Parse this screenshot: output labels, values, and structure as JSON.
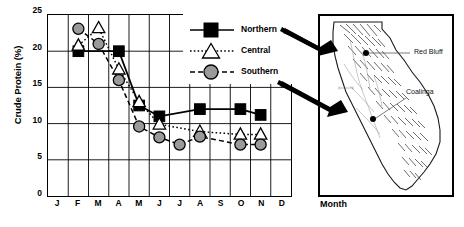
{
  "chart_data": {
    "type": "line",
    "title": "",
    "xlabel": "Month",
    "ylabel": "Crude Protein (%)",
    "categories": [
      "J",
      "F",
      "M",
      "A",
      "M",
      "J",
      "J",
      "A",
      "S",
      "O",
      "N",
      "D"
    ],
    "ylim": [
      0,
      25
    ],
    "ytick_values": [
      0,
      5,
      10,
      15,
      20,
      25
    ],
    "xlim_categories": [
      "J",
      "D"
    ],
    "grid": true,
    "legend_position": "upper-right-inside",
    "series": [
      {
        "name": "Northern",
        "marker": "filled-square",
        "line": "solid",
        "color": "#000000",
        "x": [
          "F",
          "A",
          "M",
          "J",
          "A",
          "O",
          "N"
        ],
        "values": [
          20,
          20,
          12.5,
          11,
          12,
          12,
          11.2
        ]
      },
      {
        "name": "Central",
        "marker": "open-triangle",
        "line": "dotted",
        "color": "#000000",
        "x": [
          "F",
          "M",
          "A",
          "M",
          "J",
          "A",
          "O",
          "N"
        ],
        "values": [
          20.8,
          23.2,
          17.5,
          13,
          9.9,
          8.9,
          8.5,
          8.5
        ]
      },
      {
        "name": "Southern",
        "marker": "filled-circle",
        "line": "dashed",
        "color": "#9a9a9a",
        "x": [
          "F",
          "M",
          "A",
          "M",
          "J",
          "J",
          "A",
          "O",
          "N"
        ],
        "values": [
          23.1,
          21,
          16,
          9.6,
          8.1,
          7.1,
          8.2,
          7.1,
          7.1
        ]
      }
    ]
  },
  "axes": {
    "y_title": "Crude Protein (%)",
    "y_ticks": [
      "25",
      "20",
      "15",
      "10",
      "5",
      "0"
    ],
    "x_ticks": [
      "J",
      "F",
      "M",
      "A",
      "M",
      "J",
      "J",
      "A",
      "S",
      "O",
      "N",
      "D"
    ],
    "x_title": "Month"
  },
  "legend": {
    "items": [
      {
        "label": "Northern",
        "marker": "filled-square-icon",
        "line_style": "solid"
      },
      {
        "label": "Central",
        "marker": "open-triangle-icon",
        "line_style": "dotted"
      },
      {
        "label": "Southern",
        "marker": "filled-circle-icon",
        "line_style": "dashed"
      }
    ]
  },
  "map": {
    "region": "California",
    "cities": [
      {
        "name": "Red Bluff"
      },
      {
        "name": "Coalinga"
      }
    ]
  }
}
